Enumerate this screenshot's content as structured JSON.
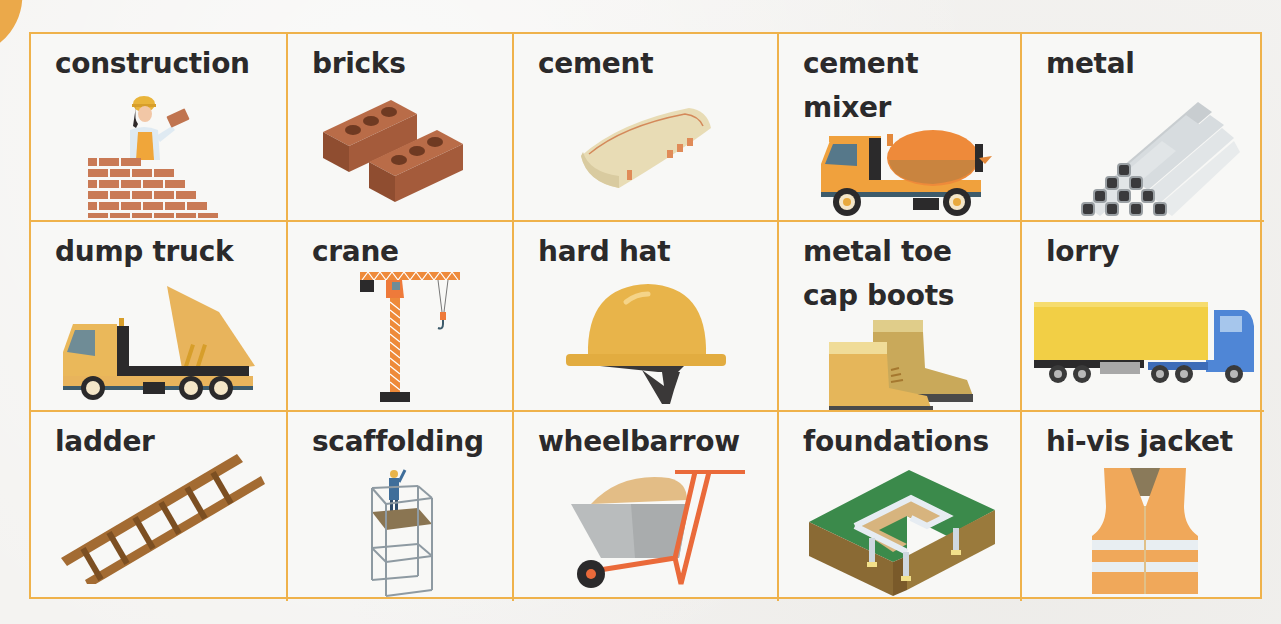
{
  "page": {
    "type": "vocabulary-card",
    "theme_colors": {
      "grid_border": "#efb24b",
      "corner_tab": "#eba94a",
      "text": "#2b2a2b",
      "background": "#f8f8f6"
    }
  },
  "cards": [
    {
      "row": 1,
      "col": 1,
      "label": "construction",
      "icon": "builder-laying-bricks-icon"
    },
    {
      "row": 1,
      "col": 2,
      "label": "bricks",
      "icon": "bricks-icon"
    },
    {
      "row": 1,
      "col": 3,
      "label": "cement",
      "icon": "cement-bag-icon"
    },
    {
      "row": 1,
      "col": 4,
      "label": "cement\nmixer",
      "icon": "cement-mixer-truck-icon"
    },
    {
      "row": 1,
      "col": 5,
      "label": "metal",
      "icon": "metal-pipes-icon"
    },
    {
      "row": 2,
      "col": 1,
      "label": "dump truck",
      "icon": "dump-truck-icon"
    },
    {
      "row": 2,
      "col": 2,
      "label": "crane",
      "icon": "tower-crane-icon"
    },
    {
      "row": 2,
      "col": 3,
      "label": "hard hat",
      "icon": "hard-hat-icon"
    },
    {
      "row": 2,
      "col": 4,
      "label": "metal toe\ncap boots",
      "icon": "work-boots-icon"
    },
    {
      "row": 2,
      "col": 5,
      "label": "lorry",
      "icon": "lorry-icon"
    },
    {
      "row": 3,
      "col": 1,
      "label": "ladder",
      "icon": "ladder-icon"
    },
    {
      "row": 3,
      "col": 2,
      "label": "scaffolding",
      "icon": "scaffolding-icon"
    },
    {
      "row": 3,
      "col": 3,
      "label": "wheelbarrow",
      "icon": "wheelbarrow-icon"
    },
    {
      "row": 3,
      "col": 4,
      "label": "foundations",
      "icon": "foundations-icon"
    },
    {
      "row": 3,
      "col": 5,
      "label": "hi-vis jacket",
      "icon": "hi-vis-jacket-icon"
    }
  ]
}
